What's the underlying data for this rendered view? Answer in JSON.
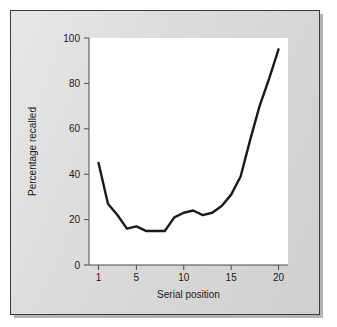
{
  "figure": {
    "background_color": "#dcdcdc",
    "plot_background_color": "#ffffff",
    "border_color": "#3a3a3a",
    "line_color": "#1a1a1a"
  },
  "chart_data": {
    "type": "line",
    "title": "",
    "xlabel": "Serial position",
    "ylabel": "Percentage recalled",
    "xlim": [
      0,
      21
    ],
    "ylim": [
      0,
      100
    ],
    "xticks": [
      1,
      5,
      10,
      15,
      20
    ],
    "xtick_labels": [
      "1",
      "5",
      "10",
      "15",
      "20"
    ],
    "yticks": [
      0,
      20,
      40,
      60,
      80,
      100
    ],
    "ytick_labels": [
      "0",
      "20",
      "40",
      "60",
      "80",
      "100"
    ],
    "grid": false,
    "legend": false,
    "legend_position": "none",
    "x": [
      1,
      2,
      3,
      4,
      5,
      6,
      7,
      8,
      9,
      10,
      11,
      12,
      13,
      14,
      15,
      16,
      17,
      18,
      19,
      20
    ],
    "values": [
      45,
      27,
      22,
      16,
      17,
      15,
      15,
      15,
      21,
      23,
      24,
      22,
      23,
      26,
      31,
      39,
      55,
      70,
      82,
      95
    ],
    "series": [
      {
        "name": "Percentage recalled",
        "values": [
          45,
          27,
          22,
          16,
          17,
          15,
          15,
          15,
          21,
          23,
          24,
          22,
          23,
          26,
          31,
          39,
          55,
          70,
          82,
          95
        ]
      }
    ],
    "annotations": []
  }
}
